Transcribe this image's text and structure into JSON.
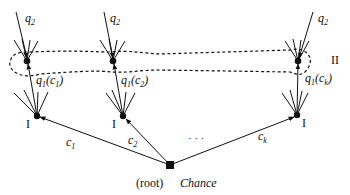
{
  "diagram": {
    "type": "game-tree",
    "root": {
      "label": "(root)",
      "player": "Chance"
    },
    "chance_edges": [
      {
        "label_main": "c",
        "label_sub": "1"
      },
      {
        "label_main": "c",
        "label_sub": "2"
      },
      {
        "label_main": "c",
        "label_sub": "k"
      }
    ],
    "ellipsis": "· · ·",
    "player1_nodes": [
      {
        "label": "I"
      },
      {
        "label": "I"
      },
      {
        "label": "I"
      }
    ],
    "player2_nodes": [
      {
        "move_label_main": "q",
        "move_label_sub": "1",
        "arg_main": "c",
        "arg_sub": "1",
        "top_label_main": "q",
        "top_label_sub": "2"
      },
      {
        "move_label_main": "q",
        "move_label_sub": "1",
        "arg_main": "c",
        "arg_sub": "2",
        "top_label_main": "q",
        "top_label_sub": "2"
      },
      {
        "move_label_main": "q",
        "move_label_sub": "1",
        "arg_main": "c",
        "arg_sub": "k",
        "top_label_main": "q",
        "top_label_sub": "2"
      }
    ],
    "information_set": {
      "label": "II"
    },
    "colors": {
      "ink": "#111111",
      "background": "#ffffff"
    }
  }
}
